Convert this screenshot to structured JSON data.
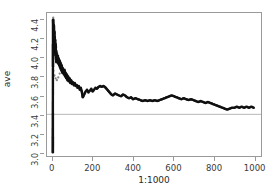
{
  "chart_data": {
    "type": "scatter",
    "title": "",
    "xlabel": "1:1000",
    "ylabel": "ave",
    "xlim": [
      -28,
      1036
    ],
    "ylim": [
      2.96,
      4.47
    ],
    "xticks": [
      0,
      200,
      400,
      600,
      800,
      1000
    ],
    "yticks": [
      3.0,
      3.2,
      3.4,
      3.6,
      3.8,
      4.0,
      4.2,
      4.4
    ],
    "grid": false,
    "legend": null,
    "point_color": "#111111",
    "point_radius": 1.25,
    "reference_line": {
      "orientation": "horizontal",
      "y": 3.4,
      "color": "#b9b9b9",
      "width": 1
    },
    "series": [
      {
        "name": "ave",
        "description": "running average of simulated draws converging toward 3.4",
        "x": [
          1,
          2,
          3,
          4,
          5,
          6,
          7,
          8,
          9,
          10,
          11,
          12,
          13,
          14,
          15,
          16,
          17,
          18,
          19,
          20,
          22,
          24,
          26,
          28,
          30,
          32,
          34,
          36,
          38,
          40,
          42,
          44,
          46,
          48,
          50,
          53,
          56,
          59,
          62,
          65,
          68,
          71,
          74,
          77,
          80,
          84,
          88,
          92,
          96,
          100,
          105,
          110,
          115,
          120,
          125,
          130,
          135,
          140,
          145,
          150,
          157,
          164,
          171,
          178,
          185,
          192,
          199,
          206,
          213,
          220,
          228,
          236,
          244,
          252,
          260,
          268,
          276,
          284,
          292,
          300,
          310,
          320,
          330,
          340,
          350,
          360,
          370,
          380,
          390,
          400,
          412,
          424,
          436,
          448,
          460,
          472,
          484,
          496,
          508,
          520,
          532,
          544,
          556,
          568,
          580,
          592,
          604,
          616,
          628,
          640,
          652,
          664,
          676,
          688,
          700,
          712,
          724,
          736,
          748,
          760,
          772,
          784,
          796,
          808,
          820,
          832,
          844,
          856,
          868,
          880,
          892,
          904,
          916,
          928,
          940,
          952,
          964,
          976,
          988,
          1000
        ],
        "y": [
          3.0,
          4.4,
          4.37,
          4.31,
          4.25,
          4.34,
          4.16,
          4.28,
          4.08,
          4.22,
          4.12,
          4.19,
          4.05,
          4.14,
          4.02,
          4.1,
          3.98,
          4.06,
          3.95,
          4.03,
          4.0,
          3.97,
          4.02,
          3.94,
          3.99,
          3.92,
          3.97,
          3.9,
          3.95,
          3.88,
          3.93,
          3.86,
          3.91,
          3.84,
          3.89,
          3.86,
          3.82,
          3.87,
          3.8,
          3.84,
          3.78,
          3.82,
          3.76,
          3.8,
          3.75,
          3.78,
          3.73,
          3.76,
          3.72,
          3.74,
          3.71,
          3.73,
          3.7,
          3.71,
          3.68,
          3.7,
          3.66,
          3.68,
          3.64,
          3.58,
          3.61,
          3.64,
          3.66,
          3.63,
          3.65,
          3.67,
          3.64,
          3.66,
          3.68,
          3.67,
          3.69,
          3.7,
          3.69,
          3.7,
          3.69,
          3.67,
          3.65,
          3.63,
          3.61,
          3.6,
          3.62,
          3.61,
          3.6,
          3.59,
          3.61,
          3.6,
          3.58,
          3.57,
          3.58,
          3.56,
          3.57,
          3.56,
          3.55,
          3.54,
          3.55,
          3.54,
          3.55,
          3.54,
          3.55,
          3.54,
          3.55,
          3.56,
          3.57,
          3.58,
          3.59,
          3.6,
          3.59,
          3.58,
          3.57,
          3.56,
          3.57,
          3.56,
          3.55,
          3.56,
          3.55,
          3.54,
          3.53,
          3.54,
          3.53,
          3.52,
          3.53,
          3.52,
          3.51,
          3.5,
          3.49,
          3.48,
          3.47,
          3.46,
          3.45,
          3.46,
          3.47,
          3.47,
          3.48,
          3.47,
          3.48,
          3.47,
          3.48,
          3.47,
          3.48,
          3.47
        ]
      }
    ],
    "early_scatter": {
      "description": "sparse widely-spread individual points in the first ~120 indices before convergence",
      "x": [
        1,
        3,
        5,
        6,
        8,
        10,
        12,
        14,
        16,
        18,
        20,
        23,
        26,
        29,
        33,
        37,
        41,
        45,
        49,
        54,
        59,
        64,
        70,
        76,
        82,
        88,
        95,
        102,
        110,
        118,
        4,
        9,
        15,
        21,
        28,
        35,
        43,
        52,
        61,
        71,
        82,
        94,
        107,
        121
      ],
      "y": [
        3.0,
        4.42,
        4.4,
        4.33,
        4.3,
        4.26,
        4.21,
        4.18,
        4.14,
        4.11,
        4.07,
        4.04,
        4.01,
        3.99,
        3.96,
        3.94,
        3.92,
        3.9,
        3.88,
        3.86,
        3.84,
        3.83,
        3.81,
        3.8,
        3.78,
        3.77,
        3.75,
        3.74,
        3.72,
        3.71,
        3.86,
        3.81,
        3.78,
        3.76,
        3.79,
        3.83,
        3.87,
        3.85,
        3.82,
        3.79,
        3.76,
        3.73,
        3.7,
        3.68
      ],
      "color": "#888888"
    }
  },
  "figure": {
    "background": "#ffffff",
    "frame_color": "#9a9a9a"
  }
}
